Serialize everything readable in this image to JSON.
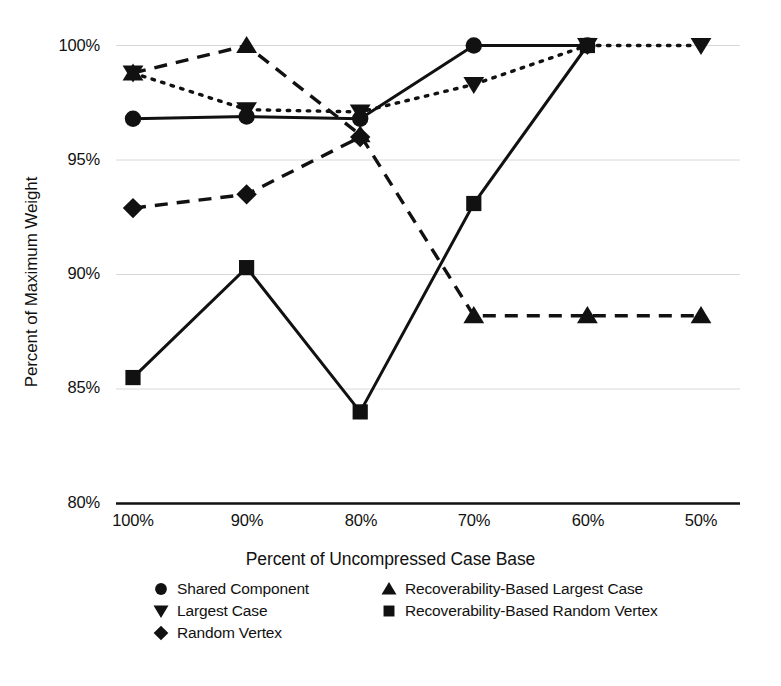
{
  "chart_data": {
    "type": "line",
    "title": "",
    "xlabel": "Percent of Uncompressed Case Base",
    "ylabel": "Percent of Maximum Weight",
    "categories": [
      "100%",
      "90%",
      "80%",
      "70%",
      "60%",
      "50%"
    ],
    "xtick_labels": [
      "100%",
      "90%",
      "80%",
      "70%",
      "60%",
      "50%"
    ],
    "ytick_labels": [
      "100%",
      "95%",
      "90%",
      "85%",
      "80%"
    ],
    "ytick_values": [
      100,
      95,
      90,
      85,
      80
    ],
    "ylim": [
      80,
      100
    ],
    "grid": "horizontal",
    "legend_position": "below-axis",
    "series": [
      {
        "name": "Shared Component",
        "marker": "circle",
        "line_style": "solid",
        "color": "#111111",
        "values": [
          96.8,
          96.9,
          96.8,
          100.0,
          100.0,
          null
        ]
      },
      {
        "name": "Largest Case",
        "marker": "triangle-down",
        "line_style": "dotted",
        "color": "#111111",
        "values": [
          98.8,
          97.2,
          97.1,
          98.3,
          100.0,
          100.0
        ]
      },
      {
        "name": "Random Vertex",
        "marker": "diamond",
        "line_style": "dashed",
        "color": "#111111",
        "values": [
          92.9,
          93.5,
          96.0,
          null,
          null,
          null
        ]
      },
      {
        "name": "Recoverability-Based Largest Case",
        "marker": "triangle-up",
        "line_style": "dashed",
        "color": "#111111",
        "values": [
          98.8,
          100.0,
          96.1,
          88.2,
          88.2,
          88.2
        ]
      },
      {
        "name": "Recoverability-Based Random Vertex",
        "marker": "square",
        "line_style": "solid",
        "color": "#111111",
        "values": [
          85.5,
          90.3,
          84.0,
          93.1,
          100.0,
          null
        ]
      }
    ]
  },
  "legend": {
    "columns": [
      {
        "items": [
          {
            "label": "Shared Component",
            "marker": "circle"
          },
          {
            "label": "Largest Case",
            "marker": "triangle-down"
          },
          {
            "label": "Random Vertex",
            "marker": "diamond"
          }
        ]
      },
      {
        "items": [
          {
            "label": "Recoverability-Based Largest Case",
            "marker": "triangle-up"
          },
          {
            "label": "Recoverability-Based Random Vertex",
            "marker": "square"
          }
        ]
      }
    ]
  },
  "axes": {
    "x_title": "Percent of Uncompressed Case Base",
    "y_title": "Percent of Maximum Weight"
  }
}
